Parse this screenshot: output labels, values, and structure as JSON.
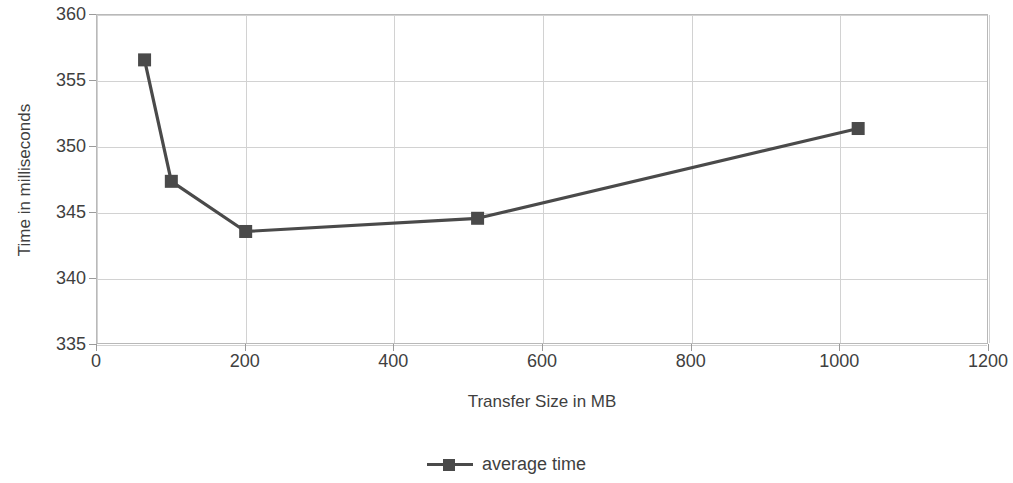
{
  "chart_data": {
    "type": "line",
    "title": "",
    "xlabel": "Transfer Size in MB",
    "ylabel": "Time in milliseconds",
    "xlim": [
      0,
      1200
    ],
    "ylim": [
      335,
      360
    ],
    "xticks": [
      0,
      200,
      400,
      600,
      800,
      1000,
      1200
    ],
    "yticks": [
      335,
      340,
      345,
      350,
      355,
      360
    ],
    "grid": true,
    "legend_position": "bottom-center",
    "series": [
      {
        "name": "average time",
        "color": "#4a4a4a",
        "marker": "square",
        "x": [
          64,
          100,
          200,
          512,
          1024
        ],
        "values": [
          356.6,
          347.4,
          343.6,
          344.6,
          351.4
        ]
      }
    ]
  },
  "axes": {
    "y_title": "Time in milliseconds",
    "x_title": "Transfer Size in MB",
    "y_tick_labels": [
      "335",
      "340",
      "345",
      "350",
      "355",
      "360"
    ],
    "x_tick_labels": [
      "0",
      "200",
      "400",
      "600",
      "800",
      "1000",
      "1200"
    ]
  },
  "legend": {
    "entries": [
      {
        "label": "average time",
        "color": "#4a4a4a"
      }
    ]
  },
  "colors": {
    "series": "#4a4a4a",
    "grid": "#d2d2d2",
    "frame": "#b9b9b9",
    "text": "#3f3f3f",
    "background": "#ffffff"
  }
}
